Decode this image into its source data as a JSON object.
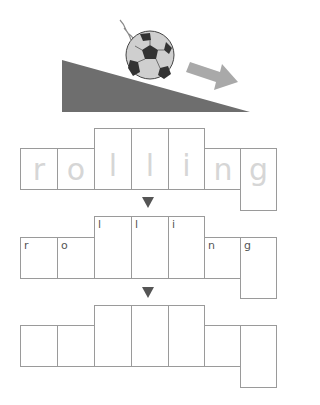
{
  "illustration": {
    "description": "soccer ball rolling down a slope with an arrow",
    "slope_color": "#6e6e6e",
    "arrow_color": "#a9a9a9"
  },
  "word": "rolling",
  "rows": [
    {
      "name": "traced",
      "letters": [
        "r",
        "o",
        "l",
        "l",
        "i",
        "n",
        "g"
      ],
      "style": "dotted-trace"
    },
    {
      "name": "guided",
      "letters": [
        "r",
        "o",
        "l",
        "l",
        "i",
        "n",
        "g"
      ],
      "style": "small-corner"
    },
    {
      "name": "blank",
      "letters": [
        "",
        "",
        "",
        "",
        "",
        "",
        ""
      ],
      "style": "empty"
    }
  ],
  "row1": {
    "l0": "r",
    "l1": "o",
    "l2": "l",
    "l3": "l",
    "l4": "i",
    "l5": "n",
    "l6": "g"
  },
  "row2": {
    "l0": "r",
    "l1": "o",
    "l2": "l",
    "l3": "l",
    "l4": "i",
    "l5": "n",
    "l6": "g"
  },
  "down_arrow": "▼"
}
